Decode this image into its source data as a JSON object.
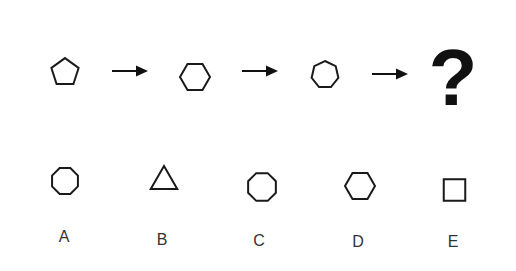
{
  "puzzle": {
    "sequence": [
      {
        "star_points": 4,
        "inner_shape": "pentagon",
        "inner_sides": 5
      },
      {
        "star_points": 5,
        "inner_shape": "hexagon",
        "inner_sides": 6
      },
      {
        "star_points": 6,
        "inner_shape": "heptagon",
        "inner_sides": 7
      }
    ],
    "arrow_icon": "right-arrow-icon",
    "question_mark": "?",
    "options": [
      {
        "label": "A",
        "star_points": 7,
        "inner_shape": "octagon",
        "inner_sides": 8
      },
      {
        "label": "B",
        "star_points": 4,
        "inner_shape": "triangle",
        "inner_sides": 3
      },
      {
        "label": "C",
        "star_points": 5,
        "inner_shape": "octagon",
        "inner_sides": 8
      },
      {
        "label": "D",
        "star_points": 7,
        "inner_shape": "hexagon",
        "inner_sides": 6
      },
      {
        "label": "E",
        "star_points": 5,
        "inner_shape": "square",
        "inner_sides": 4
      }
    ]
  },
  "colors": {
    "stroke": "#1a1a1a",
    "background": "#ffffff",
    "label": "#333333"
  }
}
